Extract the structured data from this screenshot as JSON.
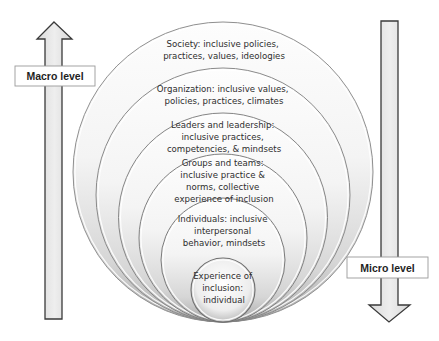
{
  "diagram": {
    "levels": [
      {
        "id": "society",
        "lines": [
          "Society: inclusive policies,",
          "practices, values, ideologies"
        ]
      },
      {
        "id": "organization",
        "lines": [
          "Organization: inclusive values,",
          "policies, practices, climates"
        ]
      },
      {
        "id": "leaders",
        "lines": [
          "Leaders and leadership:",
          "inclusive practices,",
          "competencies, & mindsets"
        ]
      },
      {
        "id": "groups",
        "lines": [
          "Groups and teams:",
          "inclusive practice &",
          "norms, collective",
          "experience of inclusion"
        ]
      },
      {
        "id": "individuals",
        "lines": [
          "Individuals: inclusive",
          "interpersonal",
          "behavior, mindsets"
        ]
      },
      {
        "id": "experience",
        "lines": [
          "Experience of",
          "inclusion:",
          "individual"
        ]
      }
    ],
    "arrows": {
      "macro": {
        "label": "Macro level",
        "direction": "up"
      },
      "micro": {
        "label": "Micro level",
        "direction": "down"
      }
    },
    "colors": {
      "ring_light": "#fbfbfb",
      "ring_dark": "#c9c9c9",
      "ring_stroke": "#8a8a8a",
      "arrow_fill": "#e6e6e6",
      "arrow_stroke": "#3a3a3a",
      "label_box_fill": "#ffffff",
      "label_box_stroke": "#9a9a9a"
    }
  }
}
